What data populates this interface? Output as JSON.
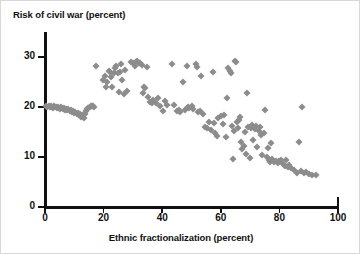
{
  "chart_data": {
    "type": "scatter",
    "title": "Risk of civil war (percent)",
    "xlabel": "Ethnic fractionalization (percent)",
    "ylabel": "Risk of civil war (percent)",
    "xlim": [
      0,
      100
    ],
    "ylim": [
      0,
      35
    ],
    "xticks": [
      0,
      20,
      40,
      60,
      80,
      100
    ],
    "yticks": [
      0,
      10,
      20,
      30
    ],
    "grid": false,
    "legend": null,
    "marker": "diamond",
    "marker_color": "#8c8c8c",
    "axis_color": "#111111",
    "background": "#ffffff",
    "series": [
      {
        "name": "countries",
        "points": [
          [
            0.3,
            20.2
          ],
          [
            0.8,
            20.1
          ],
          [
            1.2,
            20.3
          ],
          [
            1.6,
            20.0
          ],
          [
            2.0,
            20.2
          ],
          [
            2.4,
            20.1
          ],
          [
            2.8,
            19.9
          ],
          [
            3.2,
            20.2
          ],
          [
            3.6,
            20.0
          ],
          [
            4.0,
            19.8
          ],
          [
            4.4,
            20.1
          ],
          [
            4.8,
            19.9
          ],
          [
            5.2,
            19.7
          ],
          [
            5.6,
            20.0
          ],
          [
            6.0,
            19.6
          ],
          [
            6.4,
            19.8
          ],
          [
            6.8,
            19.5
          ],
          [
            7.2,
            19.7
          ],
          [
            7.6,
            19.4
          ],
          [
            8.0,
            19.6
          ],
          [
            8.4,
            19.2
          ],
          [
            8.8,
            19.5
          ],
          [
            9.2,
            19.0
          ],
          [
            9.6,
            19.3
          ],
          [
            10.0,
            18.8
          ],
          [
            10.4,
            19.1
          ],
          [
            10.8,
            18.6
          ],
          [
            11.2,
            18.9
          ],
          [
            11.6,
            18.4
          ],
          [
            12.0,
            18.7
          ],
          [
            12.4,
            18.1
          ],
          [
            12.8,
            18.4
          ],
          [
            13.2,
            17.9
          ],
          [
            13.6,
            18.6
          ],
          [
            14.0,
            19.2
          ],
          [
            14.4,
            19.6
          ],
          [
            14.8,
            19.9
          ],
          [
            15.2,
            20.1
          ],
          [
            15.6,
            20.2
          ],
          [
            16.0,
            20.3
          ],
          [
            16.4,
            20.2
          ],
          [
            16.8,
            20.1
          ],
          [
            17.5,
            28.3
          ],
          [
            19.8,
            25.4
          ],
          [
            20.4,
            26.2
          ],
          [
            20.8,
            24.1
          ],
          [
            21.3,
            25.1
          ],
          [
            21.7,
            27.3
          ],
          [
            22.1,
            27.1
          ],
          [
            22.6,
            26.0
          ],
          [
            23.0,
            24.0
          ],
          [
            23.4,
            26.8
          ],
          [
            24.0,
            27.9
          ],
          [
            24.4,
            28.2
          ],
          [
            24.8,
            26.9
          ],
          [
            25.2,
            23.0
          ],
          [
            25.6,
            27.0
          ],
          [
            26.0,
            28.7
          ],
          [
            26.4,
            25.4
          ],
          [
            26.8,
            22.6
          ],
          [
            27.2,
            27.4
          ],
          [
            28.0,
            23.2
          ],
          [
            29.4,
            29.0
          ],
          [
            30.0,
            28.9
          ],
          [
            30.6,
            28.3
          ],
          [
            31.0,
            29.1
          ],
          [
            31.5,
            29.3
          ],
          [
            32.0,
            28.8
          ],
          [
            32.5,
            28.9
          ],
          [
            33.0,
            28.5
          ],
          [
            33.4,
            22.8
          ],
          [
            33.8,
            24.1
          ],
          [
            34.2,
            23.9
          ],
          [
            34.8,
            28.0
          ],
          [
            35.2,
            22.0
          ],
          [
            35.8,
            21.0
          ],
          [
            36.4,
            20.9
          ],
          [
            37.0,
            21.4
          ],
          [
            38.0,
            20.8
          ],
          [
            38.6,
            21.8
          ],
          [
            39.2,
            20.2
          ],
          [
            40.2,
            19.2
          ],
          [
            41.0,
            21.3
          ],
          [
            41.6,
            20.4
          ],
          [
            43.4,
            28.6
          ],
          [
            44.0,
            20.5
          ],
          [
            45.0,
            19.2
          ],
          [
            45.6,
            19.4
          ],
          [
            46.0,
            19.0
          ],
          [
            47.2,
            25.1
          ],
          [
            47.8,
            19.5
          ],
          [
            48.4,
            28.2
          ],
          [
            48.8,
            20.0
          ],
          [
            49.2,
            19.8
          ],
          [
            50.0,
            20.3
          ],
          [
            50.6,
            19.6
          ],
          [
            51.4,
            28.6
          ],
          [
            51.8,
            28.0
          ],
          [
            52.2,
            19.0
          ],
          [
            52.8,
            19.3
          ],
          [
            53.4,
            26.2
          ],
          [
            54.0,
            18.7
          ],
          [
            54.6,
            16.0
          ],
          [
            55.2,
            15.9
          ],
          [
            56.0,
            17.1
          ],
          [
            56.6,
            15.4
          ],
          [
            57.2,
            27.0
          ],
          [
            57.6,
            16.9
          ],
          [
            58.0,
            14.9
          ],
          [
            58.6,
            14.2
          ],
          [
            59.2,
            17.8
          ],
          [
            60.0,
            18.3
          ],
          [
            60.6,
            16.7
          ],
          [
            61.2,
            18.5
          ],
          [
            61.8,
            14.1
          ],
          [
            62.0,
            21.8
          ],
          [
            62.6,
            27.8
          ],
          [
            63.0,
            27.2
          ],
          [
            63.4,
            26.9
          ],
          [
            63.8,
            16.2
          ],
          [
            64.2,
            9.7
          ],
          [
            64.6,
            15.3
          ],
          [
            64.8,
            29.3
          ],
          [
            65.2,
            29.0
          ],
          [
            65.4,
            17.0
          ],
          [
            65.8,
            15.9
          ],
          [
            66.2,
            17.4
          ],
          [
            66.6,
            18.0
          ],
          [
            67.0,
            13.0
          ],
          [
            67.4,
            11.6
          ],
          [
            67.8,
            12.2
          ],
          [
            68.2,
            15.0
          ],
          [
            68.6,
            10.6
          ],
          [
            69.0,
            22.9
          ],
          [
            69.4,
            16.1
          ],
          [
            69.8,
            9.8
          ],
          [
            70.2,
            15.8
          ],
          [
            70.6,
            16.4
          ],
          [
            71.0,
            13.4
          ],
          [
            71.6,
            15.6
          ],
          [
            72.0,
            16.2
          ],
          [
            72.4,
            12.1
          ],
          [
            73.0,
            15.2
          ],
          [
            73.4,
            16.0
          ],
          [
            73.8,
            14.4
          ],
          [
            74.2,
            10.5
          ],
          [
            74.8,
            14.8
          ],
          [
            75.2,
            19.4
          ],
          [
            75.6,
            10.0
          ],
          [
            76.0,
            11.8
          ],
          [
            76.4,
            9.4
          ],
          [
            76.8,
            9.1
          ],
          [
            77.2,
            12.9
          ],
          [
            77.6,
            9.6
          ],
          [
            78.2,
            9.0
          ],
          [
            78.8,
            9.3
          ],
          [
            79.4,
            8.8
          ],
          [
            80.0,
            9.2
          ],
          [
            80.6,
            9.5
          ],
          [
            81.2,
            8.6
          ],
          [
            81.8,
            8.2
          ],
          [
            82.2,
            9.4
          ],
          [
            82.8,
            8.0
          ],
          [
            83.4,
            8.5
          ],
          [
            84.0,
            7.8
          ],
          [
            85.0,
            7.4
          ],
          [
            86.0,
            6.9
          ],
          [
            86.6,
            13.0
          ],
          [
            87.4,
            7.2
          ],
          [
            87.8,
            20.1
          ],
          [
            88.4,
            6.8
          ],
          [
            89.0,
            7.0
          ],
          [
            90.0,
            6.6
          ],
          [
            91.0,
            6.5
          ],
          [
            92.4,
            6.4
          ]
        ]
      }
    ]
  }
}
